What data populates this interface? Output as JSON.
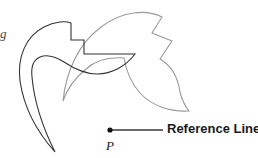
{
  "figure": {
    "type": "geometry-rotation-diagram",
    "background_color": "#ffffff",
    "width": 258,
    "height": 158,
    "preimage": {
      "name": "preimage-shape",
      "stroke_color": "#333333",
      "stroke_width": 1.1,
      "description": "dark outlined curved blade shape with rectangular notch at top"
    },
    "image": {
      "name": "rotated-image-shape",
      "stroke_color": "#9a9a9a",
      "stroke_width": 1.1,
      "description": "light gray rotated copy of the preimage shape"
    },
    "reference_line": {
      "label": "Reference Line",
      "stroke_color": "#3a3a3a",
      "stroke_width": 1.6,
      "x1": 110,
      "y1": 130,
      "x2": 163,
      "y2": 130
    },
    "center_point": {
      "label": "P",
      "fill_color": "#111111",
      "radius": 2.6,
      "cx": 110,
      "cy": 130
    },
    "edge_fragment": {
      "text": "g"
    }
  }
}
